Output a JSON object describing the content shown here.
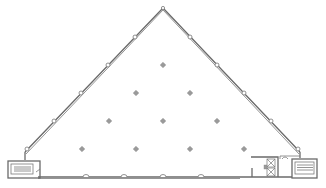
{
  "drawing": {
    "type": "floor-plan",
    "shape": "triangular",
    "colors": {
      "wall": "#6a6a6a",
      "column": "#9a9a9a",
      "background": "#ffffff"
    },
    "interior_columns": [
      [
        163,
        65
      ],
      [
        136,
        93
      ],
      [
        190,
        93
      ],
      [
        109,
        121
      ],
      [
        163,
        121
      ],
      [
        217,
        121
      ],
      [
        82,
        149
      ],
      [
        136,
        149
      ],
      [
        190,
        149
      ],
      [
        244,
        149
      ]
    ],
    "perimeter_nodes": [
      [
        163,
        8
      ],
      [
        135,
        36
      ],
      [
        190,
        36
      ],
      [
        108,
        65
      ],
      [
        217,
        65
      ],
      [
        81,
        93
      ],
      [
        244,
        93
      ],
      [
        54,
        121
      ],
      [
        271,
        121
      ],
      [
        27,
        149
      ],
      [
        298,
        149
      ],
      [
        86,
        177
      ],
      [
        124,
        177
      ],
      [
        163,
        177
      ],
      [
        201,
        177
      ]
    ],
    "cores": [
      {
        "name": "left-stair",
        "x": 8,
        "y": 160,
        "w": 32,
        "h": 17
      },
      {
        "name": "right-stair",
        "x": 292,
        "y": 158,
        "w": 26,
        "h": 19
      },
      {
        "name": "elevator-core",
        "x": 252,
        "y": 155,
        "w": 30,
        "h": 22
      }
    ]
  }
}
